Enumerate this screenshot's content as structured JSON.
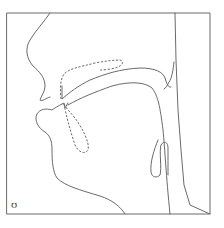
{
  "diagram": {
    "type": "vocal-tract-sagittal-section",
    "phonetic_symbol": "ʊ",
    "line_color": "#6a6a6a",
    "background": "#ffffff",
    "parts": [
      {
        "name": "frame",
        "style": "solid"
      },
      {
        "name": "upper-lip-nose",
        "style": "solid"
      },
      {
        "name": "hard-palate-upper-teeth",
        "style": "dashed"
      },
      {
        "name": "velum",
        "style": "solid"
      },
      {
        "name": "pharynx-back-wall",
        "style": "solid"
      },
      {
        "name": "tongue",
        "style": "solid"
      },
      {
        "name": "lower-lip-jaw",
        "style": "solid"
      },
      {
        "name": "lower-teeth",
        "style": "dashed"
      },
      {
        "name": "epiglottis",
        "style": "solid"
      },
      {
        "name": "larynx-front",
        "style": "solid"
      }
    ]
  }
}
